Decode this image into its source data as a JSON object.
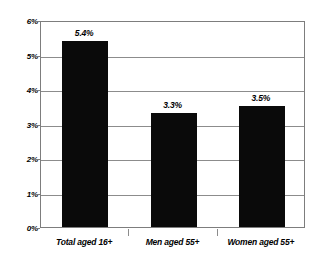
{
  "chart_data": {
    "type": "bar",
    "title": "",
    "subtitle": "",
    "xlabel": "",
    "ylabel": "",
    "categories": [
      "Total aged 16+",
      "Men aged 55+",
      "Women aged 55+"
    ],
    "values": [
      5.4,
      3.3,
      3.5
    ],
    "data_labels": [
      "5.4%",
      "3.3%",
      "3.5%"
    ],
    "ylim": [
      0,
      6
    ],
    "ytick_values": [
      0,
      1,
      2,
      3,
      4,
      5,
      6
    ],
    "ytick_labels": [
      "0%",
      "1%",
      "2%",
      "3%",
      "4%",
      "5%",
      "6%"
    ],
    "grid": true,
    "grid_axis": "y",
    "legend": false,
    "legend_position": "none",
    "bar_color": "#0a0a0a",
    "grid_color": "#8c8c8c",
    "axis_color": "#7d7d7d",
    "background_color": "#ffffff"
  }
}
